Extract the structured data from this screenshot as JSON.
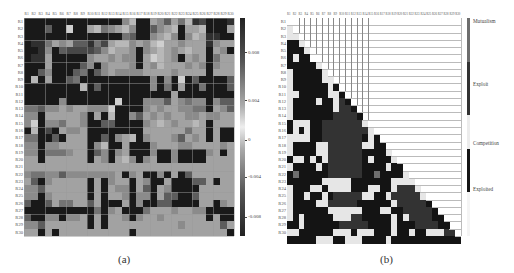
{
  "chart_data": [
    {
      "type": "heatmap",
      "panel": "(a)",
      "title": "",
      "caption": "(a)",
      "xlabels": [
        "R1",
        "R2",
        "R3",
        "R4",
        "R5",
        "R6",
        "R7",
        "R8",
        "R9",
        "R10",
        "R11",
        "R12",
        "R13",
        "R14",
        "R15",
        "R16",
        "R17",
        "R18",
        "R19",
        "R20",
        "R21",
        "R22",
        "R23",
        "R24",
        "R25",
        "R26",
        "R27",
        "R28",
        "R29",
        "R30"
      ],
      "ylabels": [
        "R1",
        "R2",
        "R3",
        "R4",
        "R5",
        "R6",
        "R7",
        "R8",
        "R9",
        "R10",
        "R11",
        "R12",
        "R13",
        "R14",
        "R15",
        "R16",
        "R17",
        "R18",
        "R19",
        "R20",
        "R21",
        "R22",
        "R23",
        "R24",
        "R25",
        "R26",
        "R27",
        "R28",
        "R29",
        "R30"
      ],
      "colorbar": {
        "ticks": [
          "0.008",
          "0.004",
          "0",
          "-0.004",
          "-0.008"
        ],
        "range": [
          -0.01,
          0.01
        ]
      },
      "value_scale_note": "cell levels 0 (darkest) to 9 (lightest)",
      "levels": [
        [
          0,
          0,
          0,
          0,
          0,
          0,
          0,
          0,
          0,
          0,
          0,
          0,
          0,
          0,
          5,
          7,
          0,
          0,
          6,
          5,
          3,
          6,
          4,
          7,
          1,
          2,
          0,
          0,
          0,
          1
        ],
        [
          0,
          0,
          0,
          3,
          0,
          0,
          8,
          0,
          0,
          6,
          7,
          4,
          5,
          6,
          7,
          5,
          0,
          0,
          3,
          5,
          6,
          7,
          0,
          6,
          6,
          7,
          0,
          0,
          0,
          6
        ],
        [
          0,
          0,
          0,
          0,
          0,
          0,
          0,
          0,
          0,
          0,
          0,
          0,
          0,
          0,
          4,
          3,
          0,
          0,
          5,
          6,
          7,
          5,
          0,
          5,
          7,
          6,
          1,
          1,
          0,
          0
        ],
        [
          0,
          1,
          1,
          4,
          6,
          5,
          6,
          3,
          3,
          1,
          4,
          2,
          6,
          7,
          7,
          5,
          6,
          5,
          7,
          8,
          6,
          6,
          5,
          6,
          6,
          6,
          1,
          5,
          6,
          6
        ],
        [
          0,
          0,
          1,
          5,
          0,
          3,
          2,
          2,
          2,
          2,
          3,
          5,
          7,
          6,
          6,
          5,
          0,
          5,
          6,
          7,
          6,
          5,
          6,
          7,
          6,
          6,
          0,
          6,
          5,
          0
        ],
        [
          0,
          1,
          1,
          6,
          0,
          0,
          0,
          0,
          0,
          5,
          6,
          6,
          5,
          6,
          5,
          5,
          0,
          6,
          8,
          7,
          6,
          5,
          0,
          6,
          5,
          6,
          0,
          4,
          6,
          6
        ],
        [
          0,
          0,
          0,
          6,
          0,
          0,
          0,
          0,
          3,
          5,
          0,
          5,
          6,
          6,
          6,
          5,
          0,
          6,
          5,
          7,
          6,
          6,
          6,
          5,
          6,
          5,
          0,
          5,
          6,
          6
        ],
        [
          0,
          0,
          3,
          5,
          0,
          0,
          0,
          3,
          4,
          0,
          3,
          5,
          6,
          5,
          5,
          5,
          5,
          6,
          6,
          6,
          6,
          5,
          6,
          6,
          6,
          6,
          0,
          6,
          6,
          6
        ],
        [
          0,
          7,
          0,
          6,
          0,
          0,
          3,
          4,
          0,
          0,
          0,
          0,
          0,
          0,
          0,
          0,
          0,
          0,
          5,
          0,
          5,
          0,
          8,
          0,
          3,
          0,
          0,
          0,
          0,
          3
        ],
        [
          0,
          0,
          0,
          0,
          0,
          0,
          0,
          0,
          7,
          0,
          3,
          0,
          0,
          0,
          0,
          0,
          0,
          0,
          5,
          0,
          4,
          0,
          6,
          0,
          0,
          4,
          0,
          0,
          0,
          3
        ],
        [
          0,
          0,
          0,
          0,
          0,
          0,
          0,
          0,
          0,
          0,
          0,
          0,
          0,
          0,
          0,
          0,
          0,
          0,
          0,
          0,
          0,
          6,
          0,
          0,
          0,
          0,
          0,
          0,
          0,
          0
        ],
        [
          0,
          0,
          0,
          0,
          0,
          5,
          0,
          0,
          0,
          0,
          0,
          0,
          0,
          8,
          0,
          0,
          0,
          5,
          5,
          5,
          3,
          6,
          5,
          4,
          5,
          5,
          0,
          5,
          3,
          3
        ],
        [
          4,
          4,
          3,
          5,
          5,
          6,
          5,
          6,
          6,
          5,
          5,
          5,
          8,
          0,
          0,
          0,
          0,
          5,
          6,
          5,
          6,
          6,
          5,
          5,
          4,
          4,
          0,
          6,
          5,
          3
        ],
        [
          5,
          5,
          0,
          6,
          6,
          6,
          6,
          6,
          5,
          0,
          6,
          0,
          7,
          0,
          0,
          5,
          3,
          6,
          5,
          6,
          5,
          6,
          6,
          5,
          5,
          6,
          5,
          5,
          6,
          6
        ],
        [
          5,
          8,
          0,
          5,
          5,
          4,
          6,
          6,
          5,
          0,
          0,
          3,
          3,
          0,
          0,
          0,
          0,
          5,
          6,
          7,
          6,
          5,
          6,
          6,
          7,
          6,
          0,
          6,
          6,
          6
        ],
        [
          0,
          7,
          0,
          2,
          0,
          6,
          5,
          5,
          6,
          0,
          0,
          0,
          0,
          0,
          0,
          0,
          0,
          6,
          6,
          6,
          6,
          6,
          6,
          4,
          6,
          6,
          0,
          6,
          0,
          0
        ],
        [
          4,
          4,
          0,
          0,
          3,
          0,
          6,
          6,
          6,
          0,
          0,
          3,
          0,
          5,
          6,
          7,
          0,
          5,
          6,
          6,
          6,
          5,
          3,
          6,
          5,
          6,
          0,
          6,
          0,
          0
        ],
        [
          5,
          5,
          0,
          5,
          5,
          6,
          6,
          6,
          6,
          0,
          5,
          7,
          0,
          0,
          6,
          0,
          0,
          0,
          5,
          6,
          6,
          6,
          5,
          5,
          6,
          6,
          6,
          6,
          5,
          6
        ],
        [
          5,
          5,
          0,
          4,
          4,
          4,
          5,
          6,
          6,
          0,
          3,
          5,
          0,
          5,
          6,
          0,
          0,
          0,
          5,
          0,
          0,
          5,
          0,
          0,
          0,
          0,
          5,
          6,
          0,
          6
        ],
        [
          6,
          6,
          0,
          6,
          6,
          6,
          6,
          6,
          6,
          0,
          6,
          5,
          0,
          6,
          7,
          5,
          0,
          5,
          6,
          0,
          0,
          5,
          0,
          0,
          0,
          0,
          6,
          6,
          6,
          6
        ],
        [
          6,
          6,
          6,
          6,
          6,
          6,
          6,
          6,
          6,
          6,
          6,
          6,
          6,
          6,
          6,
          6,
          6,
          6,
          6,
          6,
          6,
          6,
          6,
          6,
          6,
          6,
          6,
          6,
          6,
          6
        ],
        [
          5,
          4,
          4,
          5,
          5,
          3,
          5,
          5,
          5,
          5,
          5,
          5,
          5,
          6,
          0,
          5,
          6,
          0,
          0,
          5,
          0,
          6,
          0,
          3,
          6,
          6,
          6,
          6,
          6,
          6
        ],
        [
          6,
          3,
          0,
          5,
          6,
          6,
          6,
          6,
          6,
          0,
          6,
          0,
          5,
          6,
          6,
          0,
          6,
          5,
          0,
          0,
          6,
          0,
          0,
          0,
          3,
          3,
          6,
          0,
          6,
          6
        ],
        [
          5,
          5,
          3,
          6,
          6,
          6,
          6,
          6,
          6,
          0,
          6,
          0,
          6,
          5,
          5,
          0,
          6,
          3,
          0,
          6,
          5,
          0,
          0,
          0,
          0,
          6,
          6,
          6,
          6,
          6
        ],
        [
          5,
          5,
          0,
          5,
          6,
          6,
          6,
          6,
          6,
          0,
          6,
          0,
          6,
          6,
          5,
          0,
          5,
          5,
          0,
          6,
          3,
          3,
          0,
          0,
          3,
          6,
          6,
          6,
          6,
          6
        ],
        [
          3,
          0,
          0,
          3,
          6,
          4,
          4,
          6,
          6,
          3,
          6,
          0,
          0,
          0,
          6,
          0,
          5,
          0,
          0,
          3,
          3,
          0,
          0,
          0,
          0,
          6,
          6,
          0,
          5,
          6
        ],
        [
          0,
          0,
          0,
          0,
          0,
          0,
          0,
          0,
          0,
          0,
          4,
          0,
          5,
          6,
          0,
          0,
          0,
          4,
          6,
          6,
          6,
          5,
          6,
          6,
          5,
          5,
          0,
          0,
          0,
          0
        ],
        [
          3,
          0,
          0,
          5,
          5,
          0,
          5,
          5,
          6,
          0,
          6,
          0,
          6,
          6,
          5,
          0,
          5,
          6,
          6,
          5,
          6,
          6,
          6,
          6,
          6,
          6,
          0,
          6,
          0,
          0
        ],
        [
          5,
          5,
          3,
          6,
          6,
          6,
          6,
          6,
          6,
          0,
          6,
          0,
          6,
          6,
          6,
          6,
          6,
          6,
          6,
          6,
          6,
          6,
          5,
          6,
          6,
          6,
          6,
          6,
          3,
          6
        ],
        [
          6,
          6,
          0,
          6,
          0,
          6,
          6,
          6,
          6,
          6,
          6,
          6,
          6,
          6,
          6,
          0,
          6,
          6,
          6,
          6,
          6,
          6,
          6,
          6,
          6,
          6,
          6,
          6,
          6,
          0
        ]
      ]
    },
    {
      "type": "heatmap",
      "panel": "(b)",
      "title": "",
      "caption": "(b)",
      "xlabels": [
        "R1",
        "R2",
        "R3",
        "R4",
        "R5",
        "R6",
        "R7",
        "R8",
        "R9",
        "R10",
        "R11",
        "R12",
        "R13",
        "R14",
        "R15",
        "R16",
        "R17",
        "R18",
        "R19",
        "R20",
        "R21",
        "R22",
        "R23",
        "R24",
        "R25",
        "R26",
        "R27",
        "R28",
        "R29",
        "R30"
      ],
      "ylabels": [
        "R1",
        "R2",
        "R3",
        "R4",
        "R5",
        "R6",
        "R7",
        "R8",
        "R9",
        "R10",
        "R11",
        "R12",
        "R13",
        "R14",
        "R15",
        "R16",
        "R17",
        "R18",
        "R19",
        "R20",
        "R21",
        "R22",
        "R23",
        "R24",
        "R25",
        "R26",
        "R27",
        "R28",
        "R29",
        "R30"
      ],
      "legend": [
        {
          "label": "Mutualism",
          "color": "#6e6e6e",
          "code": "M"
        },
        {
          "label": "Exploit",
          "color": "#333333",
          "code": "X"
        },
        {
          "label": "Competition",
          "color": "#e6e6e6",
          "code": "C"
        },
        {
          "label": "Exploited",
          "color": "#141414",
          "code": "E"
        }
      ],
      "structure": "lower-triangular (row i shows columns 1..i-1)",
      "rows": [
        "",
        "C",
        "CC",
        "EEC",
        "EEEC",
        "ECEE",
        "EEEEEC",
        "CEEEEEC",
        "CEEEEECC",
        "CEEEEEECE",
        "CCEEEEECCEC",
        "CEEEECEECXEC",
        "CEEEEEEECXXEC",
        "CEEEEEEEXXXXE",
        "ECCCEEXXXXXXXC",
        "ECECEEXXXXXXXXC",
        "CCCCEEXXXXXXXECE",
        "CEEEECCXXXXXXCCEE",
        "CEEEECCXXXXXXEEEEC",
        "ECCECECXXXXXXECEEEC",
        "CEEEECEXXXXXXEEEECEE",
        "EMEEEEEXXXXXXEEMEEEEC",
        "EEEEEECCCCCEEEEEEECCCC",
        "CEEECCECCCCEEECCEECXXXC",
        "CEECEECEXXXXXCCEECXXXXXC",
        "CEEEECCXXXXXEEEEEECXXXXXE",
        "CEEEEEECCCCCCEEECCEEXXXXXEE",
        "CECEEEEECCCXXEEEEECECXXXXEEE",
        "EECEEEEEEXXXXXEEEECEEEXXXXEEEE",
        "CCEEEEEECCCECCCEEECEECEECCCXXXEE",
        "EEEEECCCEECCCEEEECEEEEEEEEEEEE"
      ]
    }
  ],
  "captions": {
    "a": "(a)",
    "b": "(b)"
  },
  "colorbar_a": {
    "ticks": [
      "0.008",
      "0.004",
      "0",
      "-0.004",
      "-0.008"
    ]
  },
  "legend_b": [
    "Mutualism",
    "Exploit",
    "Competition",
    "Exploited"
  ]
}
